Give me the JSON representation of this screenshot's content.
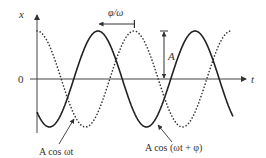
{
  "figure": {
    "axis_x_label": "x",
    "axis_t_label": "t",
    "origin_label": "0",
    "amplitude_label": "A",
    "phase_shift_label": "φ/ω",
    "curve_reference_label": "A cos ωt",
    "curve_shifted_label": "A cos (ωt + φ)",
    "colors": {
      "ink": "#333333",
      "background": "#ffffff"
    }
  },
  "chart_data": {
    "type": "line",
    "title": "",
    "xlabel": "t",
    "ylabel": "x",
    "series": [
      {
        "name": "A cos ωt",
        "style": "dotted",
        "amplitude": "A",
        "phase": 0
      },
      {
        "name": "A cos (ωt + φ)",
        "style": "solid",
        "amplitude": "A",
        "phase": "φ"
      }
    ],
    "annotations": [
      "φ/ω (horizontal shift between peaks)",
      "A (amplitude from 0 to peak)"
    ]
  }
}
